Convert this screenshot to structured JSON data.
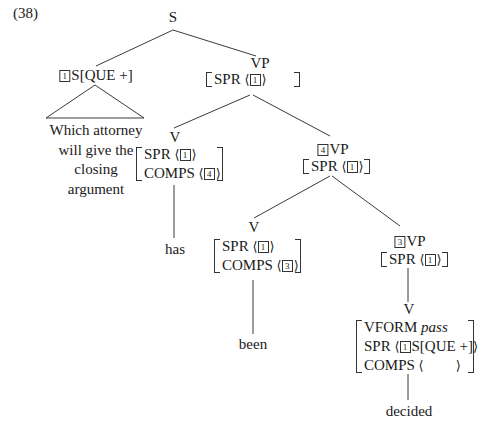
{
  "example_number": "(38)",
  "tree": {
    "root": {
      "label": "S"
    },
    "subject": {
      "tag": "1",
      "label": "S[QUE +]",
      "yield_lines": [
        "Which attorney",
        "will give the",
        "closing",
        "argument"
      ]
    },
    "vp_top": {
      "label": "VP",
      "spr_feat": "SPR",
      "spr_tag": "1"
    },
    "v_has": {
      "label": "V",
      "spr_feat": "SPR",
      "spr_tag": "1",
      "comps_feat": "COMPS",
      "comps_tag": "4",
      "word": "has"
    },
    "vp4": {
      "tag": "4",
      "label": "VP",
      "spr_feat": "SPR",
      "spr_tag": "1"
    },
    "v_been": {
      "label": "V",
      "spr_feat": "SPR",
      "spr_tag": "1",
      "comps_feat": "COMPS",
      "comps_tag": "3",
      "word": "been"
    },
    "vp3": {
      "tag": "3",
      "label": "VP",
      "spr_feat": "SPR",
      "spr_tag": "1"
    },
    "v_decided": {
      "label": "V",
      "vform_feat": "VFORM",
      "vform_val": "pass",
      "spr_feat": "SPR",
      "spr_tag": "1",
      "spr_val": "S[QUE +]",
      "comps_feat": "COMPS",
      "word": "decided"
    }
  },
  "symbols": {
    "lang": "⟨",
    "rang": "⟩"
  }
}
